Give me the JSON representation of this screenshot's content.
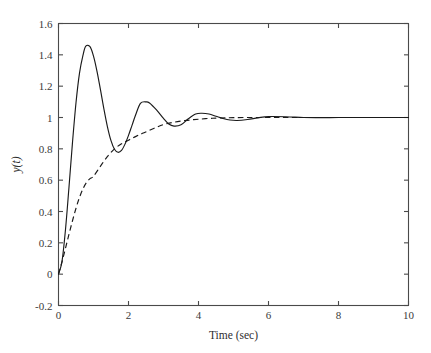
{
  "chart_data": {
    "type": "line",
    "title": "",
    "subtitle": "",
    "xlabel": "Time (sec)",
    "ylabel": "y(t)",
    "xlim": [
      0,
      10
    ],
    "ylim": [
      -0.2,
      1.6
    ],
    "xticks": [
      0,
      2,
      4,
      6,
      8,
      10
    ],
    "xtick_labels": [
      "0",
      "2",
      "4",
      "6",
      "8",
      "10"
    ],
    "yticks": [
      -0.2,
      0,
      0.2,
      0.4,
      0.6,
      0.8,
      1,
      1.2,
      1.4,
      1.6
    ],
    "ytick_labels": [
      "-0.2",
      "0",
      "0.2",
      "0.4",
      "0.6",
      "0.8",
      "1",
      "1.2",
      "1.4",
      "1.6"
    ],
    "grid": false,
    "legend": false,
    "legend_position": "none",
    "box": true,
    "tick_direction": "in",
    "background_color": "#ffffff",
    "axis_color": "#4a4a4a",
    "series": [
      {
        "name": "underdamped-step-response",
        "style": "solid",
        "color": "#1a1a1a",
        "description": "Lightly damped second order step response with ~45% overshoot settling to 1",
        "annotations": {
          "first_peak_time": 0.78,
          "first_peak_value": 1.455,
          "first_trough_time": 1.6,
          "first_trough_value": 0.79,
          "second_peak_time": 2.34,
          "second_peak_value": 1.1,
          "second_trough_time": 3.15,
          "second_trough_value": 0.955,
          "third_peak_time": 3.92,
          "third_peak_value": 1.022,
          "final_value": 1.0
        },
        "x": [
          0,
          0.1,
          0.2,
          0.3,
          0.4,
          0.5,
          0.6,
          0.7,
          0.78,
          0.9,
          1.0,
          1.1,
          1.2,
          1.3,
          1.4,
          1.5,
          1.6,
          1.7,
          1.8,
          1.9,
          2.0,
          2.1,
          2.2,
          2.34,
          2.5,
          2.6,
          2.8,
          3.0,
          3.15,
          3.3,
          3.5,
          3.7,
          3.92,
          4.1,
          4.3,
          4.5,
          4.7,
          4.9,
          5.1,
          5.4,
          5.7,
          6.0,
          6.5,
          7.0,
          7.5,
          8.0,
          8.5,
          9.0,
          9.5,
          10.0
        ],
        "y": [
          0,
          0.082,
          0.285,
          0.556,
          0.841,
          1.094,
          1.283,
          1.398,
          1.455,
          1.452,
          1.392,
          1.295,
          1.176,
          1.051,
          0.939,
          0.852,
          0.797,
          0.778,
          0.79,
          0.83,
          0.886,
          0.95,
          1.014,
          1.09,
          1.1,
          1.093,
          1.049,
          0.994,
          0.958,
          0.945,
          0.953,
          0.99,
          1.022,
          1.027,
          1.022,
          1.008,
          0.994,
          0.984,
          0.981,
          0.987,
          0.998,
          1.006,
          1.005,
          1.0,
          0.999,
          1.0,
          1.0,
          1.0,
          1.0,
          1.0
        ]
      },
      {
        "name": "damped-step-response",
        "style": "dashed",
        "color": "#1a1a1a",
        "description": "Well damped step response rising smoothly to 1 without significant overshoot",
        "annotations": {
          "rise_time_approx": 1.6,
          "value_at_1s": 0.62,
          "value_at_2s": 0.855,
          "value_at_3s": 0.955,
          "final_value": 1.0
        },
        "x": [
          0,
          0.1,
          0.2,
          0.3,
          0.4,
          0.5,
          0.6,
          0.7,
          0.8,
          0.9,
          1.0,
          1.2,
          1.4,
          1.6,
          1.8,
          2.0,
          2.2,
          2.4,
          2.6,
          2.8,
          3.0,
          3.2,
          3.4,
          3.6,
          3.8,
          4.0,
          4.3,
          4.6,
          5.0,
          5.5,
          6.0,
          6.5,
          7.0,
          7.5,
          8.0,
          8.5,
          9.0,
          9.5,
          10.0
        ],
        "y": [
          0,
          0.078,
          0.166,
          0.255,
          0.341,
          0.421,
          0.49,
          0.545,
          0.585,
          0.61,
          0.625,
          0.69,
          0.752,
          0.8,
          0.832,
          0.855,
          0.878,
          0.899,
          0.918,
          0.938,
          0.955,
          0.966,
          0.974,
          0.98,
          0.985,
          0.989,
          0.994,
          0.997,
          0.999,
          1.0,
          1.0,
          1.0,
          1.0,
          1.0,
          1.0,
          1.0,
          1.0,
          1.0,
          1.0
        ]
      }
    ]
  }
}
